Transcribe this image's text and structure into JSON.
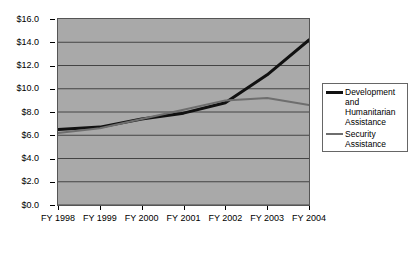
{
  "chart_data": {
    "type": "line",
    "title": "",
    "xlabel": "",
    "ylabel": "",
    "categories": [
      "FY 1998",
      "FY 1999",
      "FY 2000",
      "FY 2001",
      "FY 2002",
      "FY 2003",
      "FY 2004"
    ],
    "ylim": [
      0.0,
      16.0
    ],
    "ytick_values": [
      0.0,
      2.0,
      4.0,
      6.0,
      8.0,
      10.0,
      12.0,
      14.0,
      16.0
    ],
    "ytick_labels": [
      "$0.0",
      "$2.0",
      "$4.0",
      "$6.0",
      "$8.0",
      "$10.0",
      "$12.0",
      "$14.0",
      "$16.0"
    ],
    "grid": true,
    "legend_position": "right",
    "plot_background": "#a9a9a9",
    "series": [
      {
        "name": "Development and Humanitarian Assistance",
        "color": "#111111",
        "width": 3,
        "values": [
          6.5,
          6.7,
          7.4,
          7.9,
          8.8,
          11.2,
          14.2
        ]
      },
      {
        "name": "Security Assistance",
        "color": "#6e6e6e",
        "width": 2,
        "values": [
          6.2,
          6.6,
          7.4,
          8.2,
          9.0,
          9.2,
          8.6
        ]
      }
    ]
  },
  "legend": {
    "entries": [
      {
        "label": "Development and Humanitarian Assistance"
      },
      {
        "label": "Security Assistance"
      }
    ]
  }
}
